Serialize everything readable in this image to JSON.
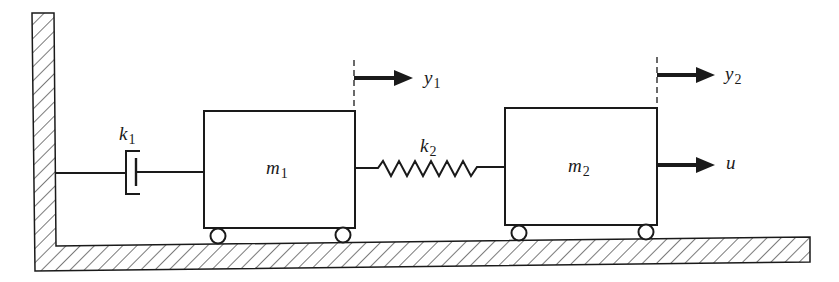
{
  "diagram": {
    "type": "two-mass mechanical system",
    "colors": {
      "stroke": "#1a1a1a",
      "background": "#ffffff",
      "hatch": "#333333"
    },
    "wall": {
      "label": ""
    },
    "ground": {
      "label": ""
    },
    "masses": [
      {
        "id": "m1",
        "symbol": "m",
        "subscript": "1"
      },
      {
        "id": "m2",
        "symbol": "m",
        "subscript": "2"
      }
    ],
    "damper": {
      "id": "k1",
      "symbol": "k",
      "subscript": "1"
    },
    "spring": {
      "id": "k2",
      "symbol": "k",
      "subscript": "2"
    },
    "displacements": [
      {
        "id": "y1",
        "symbol": "y",
        "subscript": "1"
      },
      {
        "id": "y2",
        "symbol": "y",
        "subscript": "2"
      }
    ],
    "input_force": {
      "id": "u",
      "symbol": "u"
    }
  }
}
